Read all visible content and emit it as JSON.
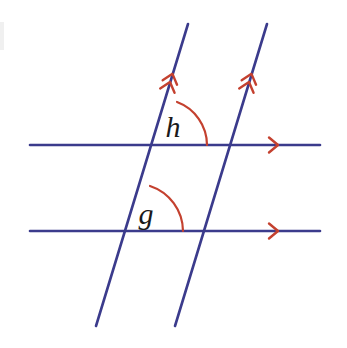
{
  "figure": {
    "background_color": "#ffffff",
    "width": 347,
    "height": 348
  },
  "colors": {
    "line": "#3b3b8c",
    "mark": "#c4412f",
    "label": "#1a1a1a",
    "smudge": "#f0f0f0"
  },
  "labels": {
    "angle_h": "h",
    "angle_g": "g"
  },
  "chart_data": {
    "type": "diagram",
    "lines": [
      {
        "name": "upper-horizontal-line",
        "kind": "horizontal-parallel",
        "x1": 30,
        "y1": 145,
        "x2": 320,
        "y2": 145,
        "color": "#3b3b8c",
        "width": 2.6,
        "marker": "single-chevron",
        "marker_count": 1,
        "marker_x": 278,
        "marker_y": 145
      },
      {
        "name": "lower-horizontal-line",
        "kind": "horizontal-parallel",
        "x1": 30,
        "y1": 231,
        "x2": 320,
        "y2": 231,
        "color": "#3b3b8c",
        "width": 2.6,
        "marker": "single-chevron",
        "marker_count": 1,
        "marker_x": 278,
        "marker_y": 231
      },
      {
        "name": "left-transversal-line",
        "kind": "transversal-parallel",
        "x1": 188,
        "y1": 24,
        "x2": 96,
        "y2": 326,
        "color": "#3b3b8c",
        "width": 2.6,
        "marker": "double-chevron",
        "marker_count": 2,
        "marker_x": 170,
        "marker_y": 82
      },
      {
        "name": "right-transversal-line",
        "kind": "transversal-parallel",
        "x1": 267,
        "y1": 24,
        "x2": 175,
        "y2": 326,
        "color": "#3b3b8c",
        "width": 2.6,
        "marker": "double-chevron",
        "marker_count": 2,
        "marker_x": 249,
        "marker_y": 82
      }
    ],
    "intersections": [
      {
        "name": "upper-left",
        "x": 161,
        "y": 145
      },
      {
        "name": "upper-right",
        "x": 240,
        "y": 145
      },
      {
        "name": "lower-left",
        "x": 135,
        "y": 231
      },
      {
        "name": "lower-right",
        "x": 214,
        "y": 231
      }
    ],
    "angle_arcs": [
      {
        "name": "angle-arc-h",
        "label": "h",
        "vertex_x": 161,
        "vertex_y": 145,
        "radius": 46,
        "start_x": 177,
        "start_y": 102,
        "end_x": 207,
        "end_y": 145,
        "color": "#c4412f",
        "width": 2.2,
        "label_x": 173,
        "label_y": 137,
        "label_size": 30
      },
      {
        "name": "angle-arc-g",
        "label": "g",
        "vertex_x": 135,
        "vertex_y": 231,
        "radius": 48,
        "start_x": 150,
        "start_y": 186,
        "end_x": 183,
        "end_y": 231,
        "color": "#c4412f",
        "width": 2.2,
        "label_x": 146,
        "label_y": 224,
        "label_size": 30
      }
    ],
    "axis_ranges": {
      "x": [
        0,
        347
      ],
      "y": [
        0,
        348
      ]
    },
    "grid": false,
    "legend": null
  }
}
